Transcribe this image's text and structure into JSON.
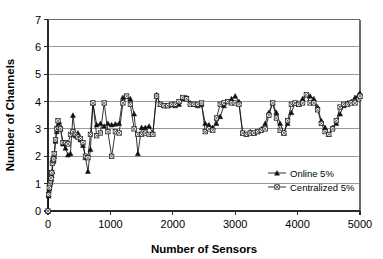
{
  "chart_data": {
    "type": "line",
    "title": "",
    "xlabel": "Number of Sensors",
    "ylabel": "Number of Channels",
    "xlim": [
      0,
      5000
    ],
    "ylim": [
      0,
      7
    ],
    "xticks": [
      0,
      1000,
      2000,
      3000,
      4000,
      5000
    ],
    "yticks": [
      0,
      1,
      2,
      3,
      4,
      5,
      6,
      7
    ],
    "grid": "horizontal",
    "legend_position": "inside-lower-right",
    "colors": {
      "series": "#111111",
      "grid": "#808080",
      "frame": "#6b6b6b",
      "axis": "#2a2a2a",
      "background": "#ffffff"
    },
    "series": [
      {
        "name": "Online 5%",
        "marker": "filled-triangle",
        "x": [
          0,
          10,
          20,
          30,
          40,
          50,
          60,
          70,
          80,
          90,
          100,
          120,
          140,
          160,
          180,
          200,
          240,
          280,
          320,
          360,
          400,
          440,
          480,
          520,
          560,
          600,
          640,
          680,
          720,
          780,
          840,
          900,
          960,
          1020,
          1080,
          1140,
          1200,
          1260,
          1320,
          1380,
          1440,
          1500,
          1560,
          1620,
          1680,
          1740,
          1800,
          1860,
          1920,
          1980,
          2040,
          2100,
          2160,
          2220,
          2280,
          2340,
          2400,
          2460,
          2520,
          2580,
          2640,
          2700,
          2760,
          2820,
          2880,
          2940,
          3000,
          3060,
          3120,
          3180,
          3240,
          3300,
          3360,
          3420,
          3480,
          3540,
          3600,
          3660,
          3720,
          3780,
          3840,
          3900,
          3960,
          4020,
          4080,
          4140,
          4200,
          4260,
          4320,
          4380,
          4440,
          4500,
          4560,
          4620,
          4680,
          4740,
          4800,
          4860,
          4920,
          4980,
          5000
        ],
        "y": [
          0.0,
          0.55,
          0.8,
          0.95,
          1.05,
          1.15,
          1.3,
          1.45,
          1.8,
          1.85,
          2.0,
          2.55,
          2.9,
          3.15,
          3.25,
          3.0,
          2.45,
          2.3,
          2.05,
          2.1,
          3.5,
          2.75,
          2.85,
          2.6,
          2.4,
          1.95,
          1.45,
          2.25,
          3.95,
          3.15,
          3.2,
          3.1,
          3.2,
          3.15,
          3.18,
          3.2,
          4.15,
          4.2,
          4.1,
          3.55,
          2.1,
          3.05,
          3.05,
          3.1,
          2.85,
          4.25,
          3.9,
          3.85,
          3.85,
          3.88,
          3.85,
          3.9,
          4.1,
          4.15,
          3.95,
          3.9,
          3.85,
          3.9,
          3.2,
          3.15,
          3.05,
          3.2,
          3.45,
          3.85,
          4.0,
          4.1,
          4.2,
          4.0,
          2.85,
          2.8,
          2.9,
          2.85,
          2.9,
          3.0,
          3.2,
          3.6,
          3.95,
          3.6,
          3.2,
          2.85,
          3.2,
          3.6,
          3.95,
          3.9,
          4.1,
          4.25,
          4.2,
          4.1,
          3.8,
          3.3,
          3.05,
          2.8,
          3.05,
          3.2,
          3.55,
          3.85,
          3.95,
          4.0,
          4.15,
          4.25,
          4.3
        ]
      },
      {
        "name": "Centralized 5%",
        "marker": "square-with-x",
        "x": [
          0,
          10,
          20,
          30,
          40,
          50,
          60,
          70,
          80,
          90,
          100,
          120,
          140,
          160,
          180,
          200,
          240,
          280,
          320,
          360,
          400,
          440,
          480,
          520,
          560,
          600,
          640,
          680,
          720,
          780,
          840,
          900,
          960,
          1020,
          1080,
          1140,
          1200,
          1260,
          1320,
          1380,
          1440,
          1500,
          1560,
          1620,
          1680,
          1740,
          1800,
          1860,
          1920,
          1980,
          2040,
          2100,
          2160,
          2220,
          2280,
          2340,
          2400,
          2460,
          2520,
          2580,
          2640,
          2700,
          2760,
          2820,
          2880,
          2940,
          3000,
          3060,
          3120,
          3180,
          3240,
          3300,
          3360,
          3420,
          3480,
          3540,
          3600,
          3660,
          3720,
          3780,
          3840,
          3900,
          3960,
          4020,
          4080,
          4140,
          4200,
          4260,
          4320,
          4380,
          4440,
          4500,
          4560,
          4620,
          4680,
          4740,
          4800,
          4860,
          4920,
          4980,
          5000
        ],
        "y": [
          0.0,
          0.6,
          0.85,
          1.0,
          1.1,
          1.2,
          1.4,
          1.75,
          1.85,
          1.9,
          2.1,
          2.6,
          3.0,
          3.3,
          3.05,
          3.0,
          2.5,
          2.5,
          2.45,
          2.8,
          2.9,
          2.8,
          2.7,
          2.65,
          2.5,
          2.0,
          1.95,
          2.8,
          3.95,
          2.75,
          2.85,
          3.95,
          2.9,
          2.0,
          2.9,
          2.85,
          3.95,
          4.2,
          3.9,
          3.0,
          2.8,
          2.8,
          2.85,
          2.8,
          2.8,
          4.2,
          3.9,
          3.85,
          3.85,
          3.9,
          3.9,
          4.0,
          4.15,
          4.1,
          3.9,
          3.9,
          3.9,
          3.95,
          2.9,
          3.0,
          2.95,
          3.4,
          3.9,
          3.95,
          4.0,
          3.95,
          3.95,
          3.9,
          2.85,
          2.8,
          2.85,
          2.85,
          2.9,
          2.95,
          3.0,
          3.5,
          3.95,
          3.4,
          2.95,
          2.85,
          3.3,
          3.9,
          3.95,
          3.9,
          3.95,
          4.25,
          3.95,
          3.95,
          3.7,
          3.2,
          2.9,
          2.8,
          3.0,
          3.3,
          3.8,
          3.9,
          3.9,
          3.95,
          3.95,
          4.1,
          4.2
        ]
      }
    ],
    "legend": [
      {
        "label": "Online 5%",
        "marker": "filled-triangle"
      },
      {
        "label": "Centralized 5%",
        "marker": "square-with-x"
      }
    ]
  }
}
